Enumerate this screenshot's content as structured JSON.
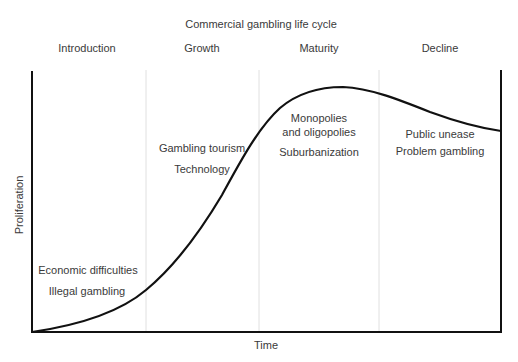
{
  "title": "Commercial gambling life cycle",
  "stages": [
    {
      "label": "Introduction",
      "factors": [
        "Economic difficulties",
        "Illegal gambling"
      ]
    },
    {
      "label": "Growth",
      "factors": [
        "Gambling tourism",
        "Technology"
      ]
    },
    {
      "label": "Maturity",
      "factors": [
        "Monopolies",
        "and oligopolies",
        "Suburbanization"
      ]
    },
    {
      "label": "Decline",
      "factors": [
        "Public unease",
        "Problem gambling"
      ]
    }
  ],
  "axes": {
    "x_label": "Time",
    "y_label": "Proliferation"
  },
  "colors": {
    "curve": "#111111",
    "axis": "#111111",
    "divider": "#dddddd",
    "text": "#3a3a3a"
  }
}
